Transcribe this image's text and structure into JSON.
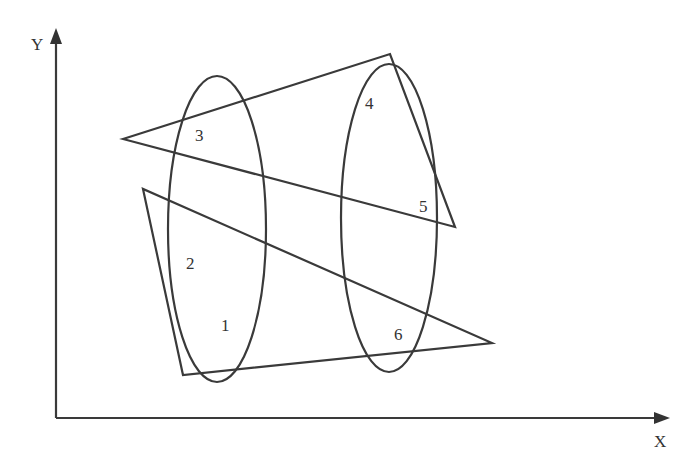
{
  "axes": {
    "x_label": "X",
    "y_label": "Y"
  },
  "shapes": {
    "triangle_lower": [
      [
        143,
        189
      ],
      [
        183,
        375
      ],
      [
        492,
        343
      ]
    ],
    "triangle_upper": [
      [
        123,
        139
      ],
      [
        390,
        54
      ],
      [
        455,
        227
      ]
    ],
    "ellipse_left": {
      "cx": 217,
      "cy": 229,
      "rx": 49,
      "ry": 153
    },
    "ellipse_right": {
      "cx": 389,
      "cy": 218,
      "rx": 48,
      "ry": 154
    }
  },
  "labels": [
    "1",
    "2",
    "3",
    "4",
    "5",
    "6"
  ]
}
